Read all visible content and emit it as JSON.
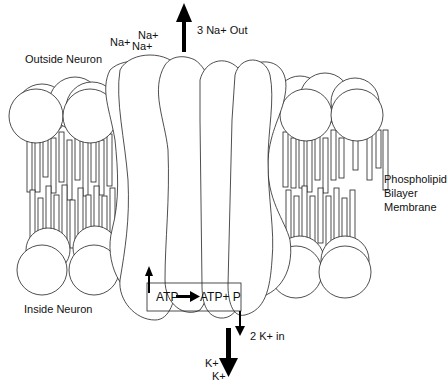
{
  "diagram": {
    "labels": {
      "outside": "Outside Neuron",
      "inside": "Inside Neuron",
      "membrane_line1": "Phospholipid",
      "membrane_line2": "Bilayer",
      "membrane_line3": "Membrane",
      "na_out": "3 Na+  Out",
      "k_in": "2 K+  in",
      "atp": "ATP",
      "atp_products": "ATP+ P"
    },
    "ions": {
      "na_1": "Na+",
      "na_2": "Na+",
      "na_3": "Na+",
      "k_1": "K+",
      "k_2": "K+"
    },
    "colors": {
      "stroke": "#222222",
      "fill": "#ffffff",
      "arrow": "#000000"
    }
  }
}
